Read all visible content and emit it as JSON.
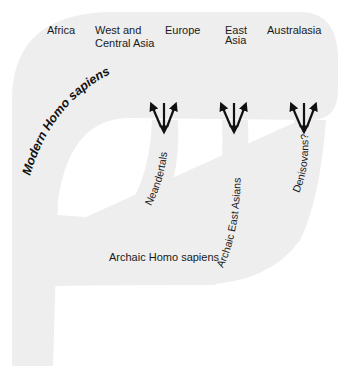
{
  "diagram": {
    "type": "population-tree",
    "band_color": "#eeeeee",
    "text_color": "#1a1a1a",
    "arrow_color": "#111111",
    "regions": [
      {
        "line1": "Africa",
        "line2": ""
      },
      {
        "line1": "West and",
        "line2": "Central Asia"
      },
      {
        "line1": "Europe",
        "line2": ""
      },
      {
        "line1": "East",
        "line2": "Asia"
      },
      {
        "line1": "Australasia",
        "line2": ""
      }
    ],
    "modern_label": {
      "prefix": "Modern ",
      "italic": "Homo sapiens"
    },
    "archaic_label": "Archaic Homo sapiens",
    "branches": [
      {
        "label": "Neandertals",
        "arrows": "gene-flow-bidirectional"
      },
      {
        "label": "Archaic East Asians",
        "arrows": "gene-flow-bidirectional"
      },
      {
        "label": "Denisovans?",
        "arrows": "gene-flow-bidirectional"
      }
    ]
  }
}
